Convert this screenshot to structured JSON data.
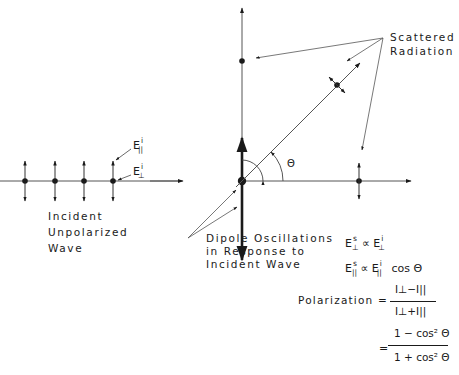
{
  "figure": {
    "labels": {
      "scattered_radiation": [
        "Scattered",
        "Radiation"
      ],
      "incident_wave": [
        "Incident",
        "Unpolarized",
        "Wave"
      ],
      "dipole": [
        "Dipole Oscillations",
        "in Response to",
        "Incident Wave"
      ],
      "e_parallel_incident": {
        "base": "E",
        "sup": "i",
        "sub": "||"
      },
      "e_perp_incident": {
        "base": "E",
        "sup": "i",
        "sub": "⊥"
      },
      "angle_symbol": "Θ"
    },
    "equations": {
      "perp_relation": {
        "lhs": "E",
        "lhs_sup": "s",
        "lhs_sub": "⊥",
        "op": "∝",
        "rhs": "E",
        "rhs_sup": "i",
        "rhs_sub": "⊥"
      },
      "parallel_relation": {
        "lhs": "E",
        "lhs_sup": "s",
        "lhs_sub": "||",
        "op": "∝",
        "rhs": "E",
        "rhs_sup": "i",
        "rhs_sub": "||",
        "tail": "cos Θ"
      },
      "polarization_label": "Polarization  =",
      "frac1_num": "I⊥−I||",
      "frac1_den": "I⊥+I||",
      "equals2": "=",
      "frac2_num": "1 − cos² Θ",
      "frac2_den": "1 + cos² Θ"
    },
    "colors": {
      "ink": "#1a1a1a",
      "line": "#555555",
      "background": "#ffffff"
    }
  }
}
